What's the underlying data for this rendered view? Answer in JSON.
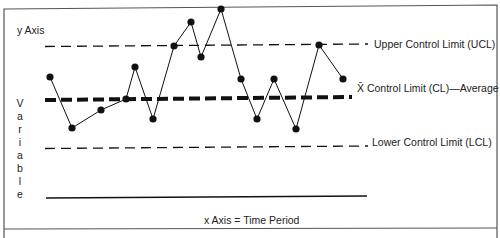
{
  "chart_data": {
    "type": "line",
    "ylabel_top": "y Axis",
    "ylabel_vertical": "Variable",
    "xlabel": "x Axis = Time Period",
    "control_lines": [
      {
        "name": "ucl",
        "label": "Upper Control Limit (UCL)",
        "style": "dashed",
        "y_px": 46
      },
      {
        "name": "cl",
        "label_prefix": "X̄",
        "label": " Control Limit (CL)—Average",
        "style": "thick-dashed",
        "y_px": 98
      },
      {
        "name": "lcl",
        "label": "Lower Control Limit (LCL)",
        "style": "dashed",
        "y_px": 148
      }
    ],
    "x_px": [
      50,
      72,
      101,
      126,
      135,
      153,
      174,
      191,
      201,
      221,
      241,
      257,
      274,
      296,
      319,
      343
    ],
    "y_px": [
      77,
      128,
      110,
      99,
      67,
      119,
      46,
      22,
      57,
      9,
      79,
      119,
      79,
      129,
      45,
      79
    ],
    "relative_position": [
      "above CL",
      "below CL",
      "below CL",
      "at CL",
      "above CL",
      "below CL",
      "at UCL",
      "above UCL",
      "above UCL",
      "above UCL",
      "above CL",
      "below CL",
      "above CL",
      "below CL",
      "at UCL",
      "above CL"
    ],
    "grid": false,
    "legend": "inline labels right of lines"
  },
  "colors": {
    "line": "#111111",
    "border": "#555555",
    "text": "#222222"
  }
}
